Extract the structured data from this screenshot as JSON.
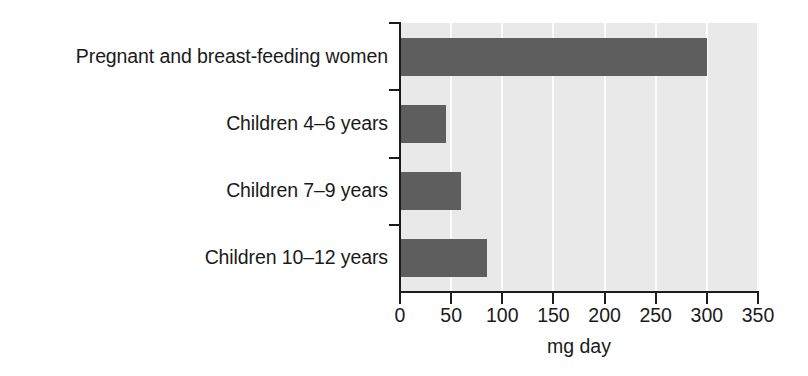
{
  "chart_data": {
    "type": "bar",
    "orientation": "horizontal",
    "title": "",
    "xlabel": "mg day",
    "ylabel": "",
    "categories": [
      "Pregnant and breast-feeding women",
      "Children 4–6 years",
      "Children 7–9 years",
      "Children 10–12 years"
    ],
    "values": [
      300,
      45,
      60,
      85
    ],
    "xlim": [
      0,
      350
    ],
    "xticks": [
      0,
      50,
      100,
      150,
      200,
      250,
      300,
      350
    ],
    "xtick_labels": [
      "0",
      "50",
      "100",
      "150",
      "200",
      "250",
      "300",
      "350"
    ],
    "grid": "vertical-only",
    "legend": "none",
    "colors": {
      "bar": "#5e5e5e",
      "plot_background": "#e9e9e9",
      "gridline": "#fbfbfb",
      "axis": "#1c1c1c",
      "text": "#1a1a1a",
      "page_background": "#ffffff"
    }
  }
}
